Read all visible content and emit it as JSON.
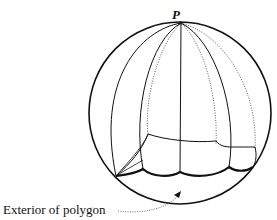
{
  "diagram": {
    "pole_label": "P",
    "caption": "Exterior of polygon",
    "colors": {
      "ink": "#111111",
      "background": "#ffffff"
    },
    "sphere": {
      "cx": 180,
      "cy": 113,
      "r": 91
    }
  }
}
